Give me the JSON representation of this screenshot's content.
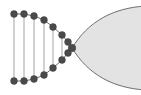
{
  "figure": {
    "canvas": {
      "width": 141,
      "height": 95,
      "background": "#ffffff"
    },
    "colors": {
      "node_fill": "#4a4a4a",
      "node_stroke": "#3c3c3c",
      "edge_stroke": "#6b6b6b",
      "chord_stroke": "#9a9a9a",
      "region_fill": "#e3e3e3",
      "region_stroke": "#6e6e6e"
    },
    "style": {
      "node_radius": 3.4,
      "apex_node_radius": 3.8,
      "edge_width": 1.0,
      "chord_width": 0.9,
      "region_stroke_width": 1.0
    },
    "apex": {
      "label": "apex-node",
      "x": 72,
      "y": 48
    },
    "top_arc": {
      "label": "upper-node-arc",
      "nodes": [
        {
          "label": "u1",
          "x": 14,
          "y": 14
        },
        {
          "label": "u2",
          "x": 24,
          "y": 14
        },
        {
          "label": "u3",
          "x": 34,
          "y": 16
        },
        {
          "label": "u4",
          "x": 44,
          "y": 20
        },
        {
          "label": "u5",
          "x": 53,
          "y": 27
        },
        {
          "label": "u6",
          "x": 62,
          "y": 35
        },
        {
          "label": "u7",
          "x": 68,
          "y": 42
        }
      ]
    },
    "bottom_arc": {
      "label": "lower-node-arc",
      "nodes": [
        {
          "label": "l1",
          "x": 14,
          "y": 81
        },
        {
          "label": "l2",
          "x": 24,
          "y": 81
        },
        {
          "label": "l3",
          "x": 34,
          "y": 79
        },
        {
          "label": "l4",
          "x": 44,
          "y": 75
        },
        {
          "label": "l5",
          "x": 53,
          "y": 68
        },
        {
          "label": "l6",
          "x": 62,
          "y": 60
        },
        {
          "label": "l7",
          "x": 68,
          "y": 53
        }
      ]
    },
    "chords": {
      "label": "vertical-chords",
      "pairs": [
        {
          "label": "c1",
          "x1": 14,
          "y1": 14,
          "x2": 14,
          "y2": 81
        },
        {
          "label": "c2",
          "x1": 24,
          "y1": 14,
          "x2": 24,
          "y2": 81
        },
        {
          "label": "c3",
          "x1": 34,
          "y1": 16,
          "x2": 34,
          "y2": 79
        },
        {
          "label": "c4",
          "x1": 44,
          "y1": 20,
          "x2": 44,
          "y2": 75
        },
        {
          "label": "c5",
          "x1": 53,
          "y1": 27,
          "x2": 53,
          "y2": 68
        },
        {
          "label": "c6",
          "x1": 62,
          "y1": 35,
          "x2": 62,
          "y2": 60
        }
      ]
    },
    "region": {
      "label": "filled-lens-region",
      "path": "M 72 48 C 88 22 112 8 146 6 L 146 90 C 112 88 88 74 72 48 Z",
      "fill": "#e3e3e3",
      "stroke": "#6e6e6e"
    },
    "top_path": "M 14 14 L 24 14 L 34 16 L 44 20 L 53 27 L 62 35 L 68 42 L 72 48",
    "bottom_path": "M 14 81 L 24 81 L 34 79 L 44 75 L 53 68 L 62 60 L 68 53 L 72 48"
  }
}
